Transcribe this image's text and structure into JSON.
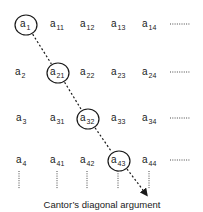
{
  "diagram": {
    "caption": "Cantor’s diagonal argument",
    "rows": [
      {
        "label": {
          "base": "a",
          "sub": "1"
        },
        "cells": [
          {
            "base": "a",
            "sub": "11"
          },
          {
            "base": "a",
            "sub": "12"
          },
          {
            "base": "a",
            "sub": "13"
          },
          {
            "base": "a",
            "sub": "14"
          }
        ]
      },
      {
        "label": {
          "base": "a",
          "sub": "2"
        },
        "cells": [
          {
            "base": "a",
            "sub": "21"
          },
          {
            "base": "a",
            "sub": "22"
          },
          {
            "base": "a",
            "sub": "23"
          },
          {
            "base": "a",
            "sub": "24"
          }
        ]
      },
      {
        "label": {
          "base": "a",
          "sub": "3"
        },
        "cells": [
          {
            "base": "a",
            "sub": "31"
          },
          {
            "base": "a",
            "sub": "32"
          },
          {
            "base": "a",
            "sub": "33"
          },
          {
            "base": "a",
            "sub": "34"
          }
        ]
      },
      {
        "label": {
          "base": "a",
          "sub": "4"
        },
        "cells": [
          {
            "base": "a",
            "sub": "41"
          },
          {
            "base": "a",
            "sub": "42"
          },
          {
            "base": "a",
            "sub": "43"
          },
          {
            "base": "a",
            "sub": "44"
          }
        ]
      }
    ],
    "circled": [
      {
        "row": 0,
        "col": -1
      },
      {
        "row": 1,
        "col": 0
      },
      {
        "row": 2,
        "col": 1
      },
      {
        "row": 3,
        "col": 2
      }
    ],
    "continuation": "horizontal-dots-each-row, vertical-dots-below-last-row",
    "line_color": "#1a1a1a"
  }
}
